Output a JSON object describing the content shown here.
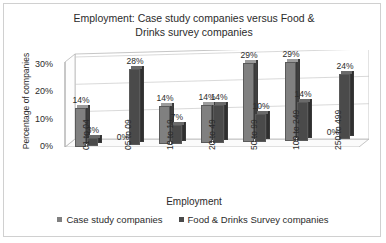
{
  "chart_data": {
    "type": "bar",
    "title": "Employment: Case study companies versus Food & Drinks survey companies",
    "title_line1": "Employment: Case study companies versus Food &",
    "title_line2": "Drinks survey companies",
    "xlabel": "Employment",
    "ylabel": "Percentage of companies",
    "ylim": [
      0,
      35
    ],
    "ytick_labels": [
      "0%",
      "10%",
      "20%",
      "30%"
    ],
    "ytick_values": [
      0,
      10,
      20,
      30
    ],
    "grid": true,
    "legend_position": "bottom",
    "categories": [
      "01 to 04",
      "05 to 09",
      "10 to 19",
      "20 to 49",
      "50 to 99",
      "100 to 249",
      "250 to 499"
    ],
    "series": [
      {
        "name": "Case study companies",
        "color": "#808080",
        "values": [
          14,
          0,
          14,
          14,
          29,
          29,
          0
        ],
        "labels": [
          "14%",
          "0%",
          "14%",
          "14%",
          "29%",
          "29%",
          "0%"
        ]
      },
      {
        "name": "Food & Drinks Survey companies",
        "color": "#4a4a4a",
        "values": [
          3,
          28,
          7,
          14,
          10,
          14,
          24
        ],
        "labels": [
          "3%",
          "28%",
          "7%",
          "14%",
          "10%",
          "14%",
          "24%"
        ]
      }
    ]
  },
  "legend": {
    "items": [
      {
        "label": "Case study companies",
        "color": "#808080"
      },
      {
        "label": "Food & Drinks Survey companies",
        "color": "#4a4a4a"
      }
    ]
  }
}
